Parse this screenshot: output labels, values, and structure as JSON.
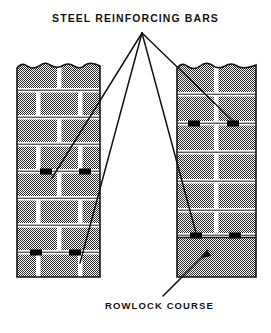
{
  "figure": {
    "type": "technical-illustration",
    "background_color": "#ffffff",
    "ink_color": "#141414",
    "brick_fill_color": "#808080",
    "mortar_color": "#ffffff",
    "rebar_marker_color": "#000000"
  },
  "labels": {
    "title": "STEEL REINFORCING BARS",
    "rowlock": "ROWLOCK COURSE"
  },
  "leader_lines": {
    "origin": {
      "x": 142,
      "y": 33
    },
    "targets": [
      {
        "name": "left-wall-upper-rebar",
        "x": 52,
        "y": 178
      },
      {
        "name": "left-wall-lower-rebar",
        "x": 80,
        "y": 263
      },
      {
        "name": "right-wall-upper-rebar",
        "x": 233,
        "y": 121
      },
      {
        "name": "right-wall-lower-rebar",
        "x": 196,
        "y": 233
      }
    ]
  },
  "rowlock_arrow": {
    "from": {
      "x": 163,
      "y": 296
    },
    "to": {
      "x": 207,
      "y": 249
    }
  },
  "walls": [
    {
      "name": "left-wall",
      "bond": "running",
      "x": 17,
      "y": 62,
      "width": 83,
      "height": 215,
      "top_edge": "broken",
      "courses": 8,
      "rebar_courses": [
        4,
        7
      ]
    },
    {
      "name": "right-wall",
      "bond": "stacked",
      "x": 177,
      "y": 62,
      "width": 79,
      "height": 215,
      "top_edge": "broken",
      "courses": 6,
      "rebar_courses": [
        2,
        6
      ],
      "rowlock_course": {
        "y": 237,
        "height": 40,
        "solid": true
      }
    }
  ]
}
